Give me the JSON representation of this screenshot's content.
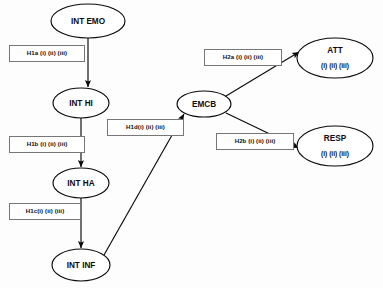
{
  "diagram": {
    "background_color": "#fdfdfd",
    "stroke_color": "#0a0a0a",
    "box_border_color": "#777777",
    "nodes": [
      {
        "id": "int-emo",
        "label": "INT EMO",
        "sublabel": "",
        "cx": 88,
        "cy": 21,
        "rx": 37,
        "ry": 17
      },
      {
        "id": "int-hi",
        "label": "INT  HI",
        "sublabel": "",
        "cx": 81,
        "cy": 103,
        "rx": 28,
        "ry": 15
      },
      {
        "id": "int-ha",
        "label": "INT HA",
        "sublabel": "",
        "cx": 81,
        "cy": 183,
        "rx": 28,
        "ry": 15
      },
      {
        "id": "int-inf",
        "label": "INT INF",
        "sublabel": "",
        "cx": 81,
        "cy": 265,
        "rx": 29,
        "ry": 16
      },
      {
        "id": "emcb",
        "label": "EMCB",
        "sublabel": "",
        "cx": 204,
        "cy": 104,
        "rx": 27,
        "ry": 13
      },
      {
        "id": "att",
        "label": "ATT",
        "sublabel": "(i) (ii) (iii)",
        "cx": 335,
        "cy": 58,
        "rx": 38,
        "ry": 20
      },
      {
        "id": "resp",
        "label": "RESP",
        "sublabel": "(i) (ii) (iii)",
        "cx": 335,
        "cy": 146,
        "rx": 38,
        "ry": 20
      }
    ],
    "edges": [
      {
        "id": "edge-emo-hi",
        "from": "int-emo",
        "to": "int-hi",
        "x1": 88,
        "y1": 38,
        "x2": 88,
        "y2": 87
      },
      {
        "id": "edge-hi-ha",
        "from": "int-hi",
        "to": "int-ha",
        "x1": 81,
        "y1": 118,
        "x2": 81,
        "y2": 167
      },
      {
        "id": "edge-ha-inf",
        "from": "int-ha",
        "to": "int-inf",
        "x1": 81,
        "y1": 198,
        "x2": 81,
        "y2": 248
      },
      {
        "id": "edge-inf-emcb",
        "from": "int-inf",
        "to": "emcb",
        "x1": 104,
        "y1": 255,
        "x2": 184,
        "y2": 114
      },
      {
        "id": "edge-emcb-att",
        "from": "emcb",
        "to": "att",
        "x1": 226,
        "y1": 96,
        "x2": 299,
        "y2": 52
      },
      {
        "id": "edge-emcb-resp",
        "from": "emcb",
        "to": "resp",
        "x1": 226,
        "y1": 113,
        "x2": 299,
        "y2": 148
      }
    ],
    "hypothesis_labels": [
      {
        "id": "h1a",
        "text": "H1a (i) (ii) (iii)",
        "x": 9,
        "y": 45,
        "w": 76,
        "h": 17
      },
      {
        "id": "h1b",
        "text": "H1b (i) (ii) (iii)",
        "x": 9,
        "y": 136,
        "w": 76,
        "h": 17
      },
      {
        "id": "h1c",
        "text": "H1c(i) (ii) (iii)",
        "x": 9,
        "y": 203,
        "w": 72,
        "h": 17
      },
      {
        "id": "h1d",
        "text": "H1d(i) (ii) (iii)",
        "x": 107,
        "y": 119,
        "w": 77,
        "h": 17
      },
      {
        "id": "h2a",
        "text": "H2a (i) (ii) (iii)",
        "x": 204,
        "y": 49,
        "w": 78,
        "h": 17
      },
      {
        "id": "h2b",
        "text": "H2b (i) (ii) (iii)",
        "x": 216,
        "y": 133,
        "w": 78,
        "h": 17
      }
    ]
  }
}
